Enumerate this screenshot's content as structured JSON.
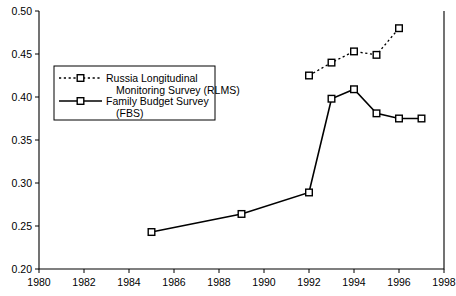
{
  "chart_data": {
    "type": "line",
    "title": "",
    "subtitle": "",
    "xlabel": "",
    "ylabel": "",
    "xlim": [
      1980,
      1998
    ],
    "ylim": [
      0.2,
      0.5
    ],
    "xticks": [
      1980,
      1982,
      1984,
      1986,
      1988,
      1990,
      1992,
      1994,
      1996,
      1998
    ],
    "xtick_labels": [
      "1980",
      "1982",
      "1984",
      "1986",
      "1988",
      "1990",
      "1992",
      "1994",
      "1996",
      "1998"
    ],
    "yticks": [
      0.2,
      0.25,
      0.3,
      0.35,
      0.4,
      0.45,
      0.5
    ],
    "ytick_labels": [
      "0.20",
      "0.25",
      "0.30",
      "0.35",
      "0.40",
      "0.45",
      "0.50"
    ],
    "grid": false,
    "legend_position": "upper left",
    "series": [
      {
        "name": "Russia Longitudinal Monitoring Survey (RLMS)",
        "legend_line_1": "Russia Longitudinal",
        "legend_line_2": "Monitoring Survey (RLMS)",
        "linestyle": "dotted",
        "marker": "open-square",
        "color": "#000000",
        "x": [
          1992,
          1993,
          1994,
          1995,
          1996
        ],
        "values": [
          0.425,
          0.44,
          0.453,
          0.449,
          0.48
        ]
      },
      {
        "name": "Family Budget Survey (FBS)",
        "legend_line_1": "Family Budget Survey",
        "legend_line_2": "(FBS)",
        "linestyle": "solid",
        "marker": "open-square",
        "color": "#000000",
        "x": [
          1985,
          1989,
          1992,
          1993,
          1994,
          1995,
          1996,
          1997
        ],
        "values": [
          0.243,
          0.264,
          0.289,
          0.398,
          0.409,
          0.381,
          0.375,
          0.375
        ]
      }
    ]
  }
}
